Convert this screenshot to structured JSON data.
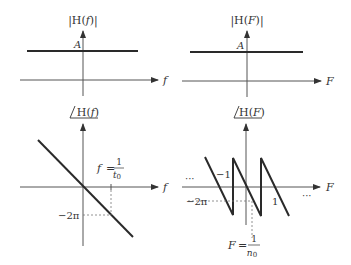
{
  "figure": {
    "panels": [
      {
        "id": "mag-continuous",
        "y_label_pre": "|H(",
        "y_label_var": "f",
        "y_label_post": ")|",
        "x_label": "f",
        "level_label": "A"
      },
      {
        "id": "mag-discrete",
        "y_label_pre": "|H(",
        "y_label_var": "F",
        "y_label_post": ")|",
        "x_label": "F",
        "level_label": "A"
      },
      {
        "id": "phase-continuous",
        "y_label_pre": "H(",
        "y_label_var": "f",
        "y_label_post": ")",
        "x_label": "f",
        "minus_2pi": "−2π",
        "marker_lhs": "f",
        "marker_eq": "=",
        "marker_num": "1",
        "marker_den": "t",
        "marker_den_sub": "0"
      },
      {
        "id": "phase-discrete",
        "y_label_pre": "H(",
        "y_label_var": "F",
        "y_label_post": ")",
        "x_label": "F",
        "minus_2pi": "−2π",
        "tick_neg": "−1",
        "tick_pos": "1",
        "ellipsis_left": "···",
        "ellipsis_right": "···",
        "marker_lhs": "F",
        "marker_eq": "=",
        "marker_num": "1",
        "marker_den": "n",
        "marker_den_sub": "0"
      }
    ]
  }
}
